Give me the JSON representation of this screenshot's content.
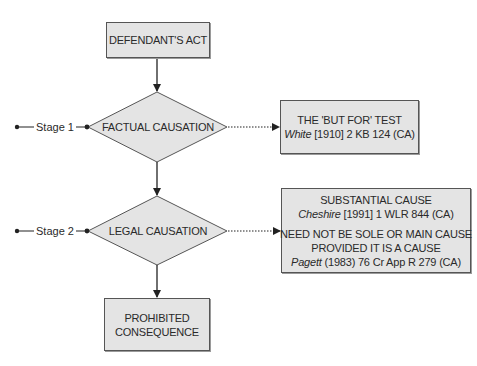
{
  "diagram": {
    "start": {
      "label": "DEFENDANT'S ACT"
    },
    "stages": [
      {
        "stage_label": "Stage 1",
        "decision": "FACTUAL CAUSATION",
        "result": {
          "title": "THE 'BUT FOR' TEST",
          "case_name": "White",
          "citation": " [1910] 2 KB 124 (CA)"
        }
      },
      {
        "stage_label": "Stage 2",
        "decision": "LEGAL CAUSATION",
        "result": {
          "title": "SUBSTANTIAL CAUSE",
          "case_name": "Cheshire",
          "citation": " [1991] 1 WLR 844 (CA)",
          "title2_line1": "NEED NOT BE SOLE OR MAIN CAUSE",
          "title2_line2": "PROVIDED IT IS A CAUSE",
          "case_name2": "Pagett",
          "citation2": " (1983) 76 Cr App R 279 (CA)"
        }
      }
    ],
    "end": {
      "line1": "PROHIBITED",
      "line2": "CONSEQUENCE"
    },
    "colors": {
      "box_fill": "#e4e4e4",
      "stroke": "#333333"
    }
  }
}
